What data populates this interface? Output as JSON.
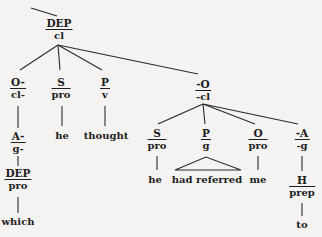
{
  "diagram": {
    "type": "systemic-functional-grammar tree",
    "root": {
      "function": "DEP",
      "class": "cl"
    },
    "nodes": {
      "root": {
        "function": "DEP",
        "class": "cl"
      },
      "o1": {
        "function": "O-",
        "class": "cl-"
      },
      "s1": {
        "function": "S",
        "class": "pro"
      },
      "p1": {
        "function": "P",
        "class": "v"
      },
      "o2": {
        "function": "-O",
        "class": "-cl"
      },
      "a1": {
        "function": "A-",
        "class": "g-"
      },
      "dep2": {
        "function": "DEP",
        "class": "pro"
      },
      "s2": {
        "function": "S",
        "class": "pro"
      },
      "p2": {
        "function": "P",
        "class": "g"
      },
      "o3": {
        "function": "O",
        "class": "pro"
      },
      "a2": {
        "function": "-A",
        "class": "-g"
      },
      "h1": {
        "function": "H",
        "class": "prep"
      }
    },
    "leaves": {
      "he1": "he",
      "thought": "thought",
      "which": "which",
      "he2": "he",
      "had_referred": "had referred",
      "me": "me",
      "to": "to"
    }
  }
}
